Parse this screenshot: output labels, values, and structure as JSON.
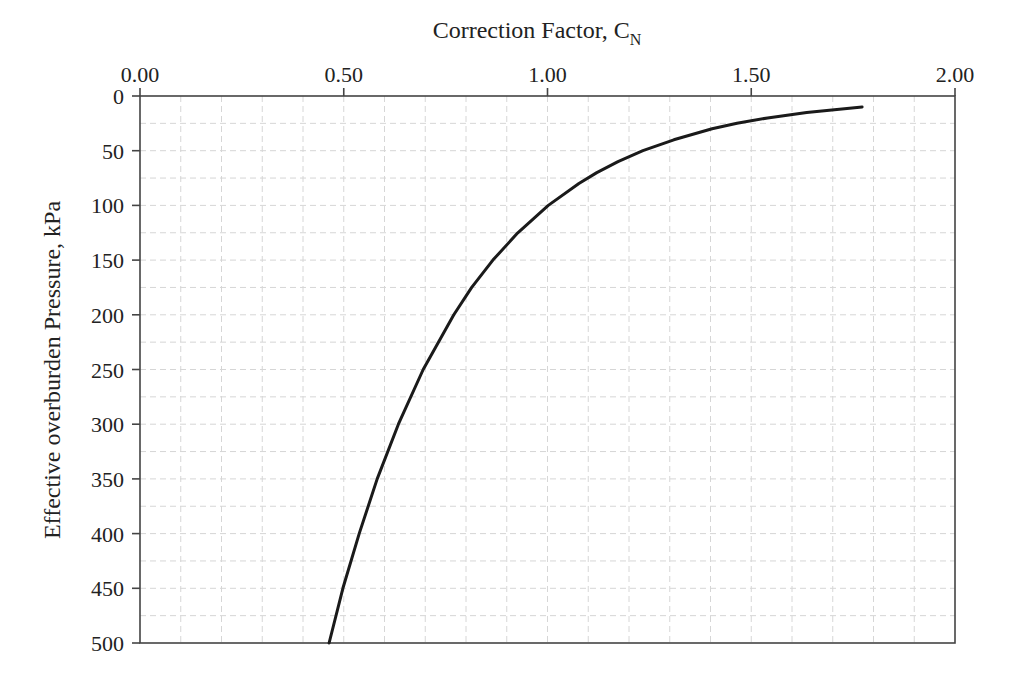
{
  "chart_data": {
    "type": "line",
    "title": "",
    "xlabel": "Correction Factor, C",
    "xlabel_subscript": "N",
    "ylabel": "Effective overburden Pressure, kPa",
    "x_axis_position": "top",
    "y_axis_inverted": true,
    "xlim": [
      0.0,
      2.0
    ],
    "ylim": [
      0,
      500
    ],
    "x_ticks": [
      "0.00",
      "0.50",
      "1.00",
      "1.50",
      "2.00"
    ],
    "x_tick_values": [
      0.0,
      0.5,
      1.0,
      1.5,
      2.0
    ],
    "y_ticks": [
      "0",
      "50",
      "100",
      "150",
      "200",
      "250",
      "300",
      "350",
      "400",
      "450",
      "500"
    ],
    "y_tick_values": [
      0,
      50,
      100,
      150,
      200,
      250,
      300,
      350,
      400,
      450,
      500
    ],
    "grid": {
      "major": false,
      "minor": true,
      "x_minor_step": 0.1,
      "y_minor_step": 25,
      "style": "dashed light gray"
    },
    "legend": null,
    "series": [
      {
        "name": "C_N",
        "color": "#1a1a1a",
        "note": "C_N = 0.77 log10(2000 / sigma'v)",
        "points": [
          {
            "cn": 1.772,
            "p": 10
          },
          {
            "cn": 1.636,
            "p": 15
          },
          {
            "cn": 1.54,
            "p": 20
          },
          {
            "cn": 1.465,
            "p": 25
          },
          {
            "cn": 1.404,
            "p": 30
          },
          {
            "cn": 1.31,
            "p": 40
          },
          {
            "cn": 1.234,
            "p": 50
          },
          {
            "cn": 1.173,
            "p": 60
          },
          {
            "cn": 1.121,
            "p": 70
          },
          {
            "cn": 1.077,
            "p": 80
          },
          {
            "cn": 1.002,
            "p": 100
          },
          {
            "cn": 0.927,
            "p": 125
          },
          {
            "cn": 0.866,
            "p": 150
          },
          {
            "cn": 0.814,
            "p": 175
          },
          {
            "cn": 0.77,
            "p": 200
          },
          {
            "cn": 0.695,
            "p": 250
          },
          {
            "cn": 0.634,
            "p": 300
          },
          {
            "cn": 0.582,
            "p": 350
          },
          {
            "cn": 0.538,
            "p": 400
          },
          {
            "cn": 0.498,
            "p": 450
          },
          {
            "cn": 0.464,
            "p": 500
          }
        ]
      }
    ]
  },
  "labels": {
    "x_title": "Correction Factor, C",
    "x_title_sub": "N",
    "y_title": "Effective overburden Pressure, kPa"
  }
}
